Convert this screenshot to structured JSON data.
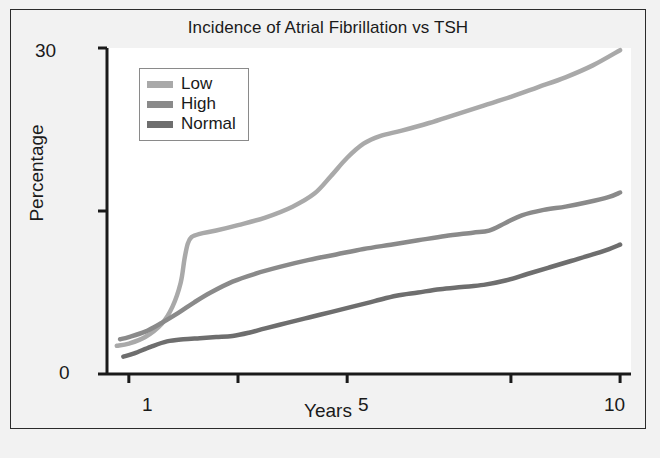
{
  "figure": {
    "background_color": "#f2f2f2",
    "plot_background_color": "#ffffff",
    "border_color": "#2b2b2b"
  },
  "legend": {
    "position": "top-left-inside",
    "entries": [
      {
        "label": "Low",
        "color": "#a9a9a9"
      },
      {
        "label": "High",
        "color": "#8a8a8a"
      },
      {
        "label": "Normal",
        "color": "#6e6e6e"
      }
    ]
  },
  "axes": {
    "y_ticks_labeled": [
      "30",
      "0"
    ],
    "x_ticks_labeled": [
      "1",
      "5",
      "10"
    ]
  },
  "chart_data": {
    "type": "line",
    "title": "Incidence of Atrial Fibrillation vs TSH",
    "xlabel": "Years",
    "ylabel": "Percentage",
    "xlim": [
      0.6,
      10.2
    ],
    "ylim": [
      0,
      30
    ],
    "x_ticks": [
      1,
      3,
      5,
      8,
      10
    ],
    "x_tick_labels": [
      "1",
      "",
      "5",
      "",
      "10"
    ],
    "y_ticks": [
      0,
      15,
      30
    ],
    "y_tick_labels": [
      "0",
      "",
      "30"
    ],
    "grid": false,
    "legend_position": "upper left",
    "series": [
      {
        "name": "Low",
        "color": "#a9a9a9",
        "x": [
          0.78,
          1.0,
          1.3,
          1.6,
          1.8,
          1.95,
          2.02,
          2.08,
          2.15,
          2.3,
          2.6,
          3.0,
          3.5,
          4.0,
          4.4,
          4.7,
          5.0,
          5.3,
          5.6,
          6.0,
          6.5,
          7.0,
          7.5,
          8.0,
          8.5,
          9.0,
          9.5,
          10.0
        ],
        "y": [
          2.6,
          2.8,
          3.4,
          4.6,
          6.2,
          8.4,
          10.6,
          12.0,
          12.6,
          12.9,
          13.2,
          13.7,
          14.4,
          15.4,
          16.6,
          18.2,
          19.9,
          21.2,
          21.9,
          22.4,
          23.1,
          23.9,
          24.7,
          25.5,
          26.4,
          27.3,
          28.4,
          29.8
        ]
      },
      {
        "name": "High",
        "color": "#8a8a8a",
        "x": [
          0.84,
          1.0,
          1.3,
          1.6,
          1.9,
          2.2,
          2.5,
          2.9,
          3.3,
          3.8,
          4.3,
          4.8,
          5.3,
          5.8,
          6.3,
          6.8,
          7.3,
          7.6,
          7.9,
          8.2,
          8.6,
          9.0,
          9.4,
          9.8,
          10.0
        ],
        "y": [
          3.2,
          3.4,
          3.9,
          4.7,
          5.6,
          6.6,
          7.5,
          8.5,
          9.2,
          9.9,
          10.5,
          11.0,
          11.5,
          11.9,
          12.3,
          12.7,
          13.0,
          13.2,
          13.9,
          14.6,
          15.1,
          15.4,
          15.8,
          16.3,
          16.7
        ]
      },
      {
        "name": "Normal",
        "color": "#6e6e6e",
        "x": [
          0.9,
          1.1,
          1.4,
          1.7,
          2.0,
          2.3,
          2.6,
          2.9,
          3.2,
          3.5,
          3.9,
          4.3,
          4.7,
          5.1,
          5.5,
          5.9,
          6.3,
          6.7,
          7.1,
          7.5,
          7.9,
          8.3,
          8.7,
          9.1,
          9.5,
          9.8,
          10.0
        ],
        "y": [
          1.6,
          1.9,
          2.5,
          3.0,
          3.2,
          3.3,
          3.4,
          3.5,
          3.8,
          4.2,
          4.7,
          5.2,
          5.7,
          6.2,
          6.7,
          7.2,
          7.5,
          7.8,
          8.0,
          8.2,
          8.6,
          9.2,
          9.8,
          10.4,
          11.0,
          11.5,
          11.9
        ]
      }
    ]
  }
}
